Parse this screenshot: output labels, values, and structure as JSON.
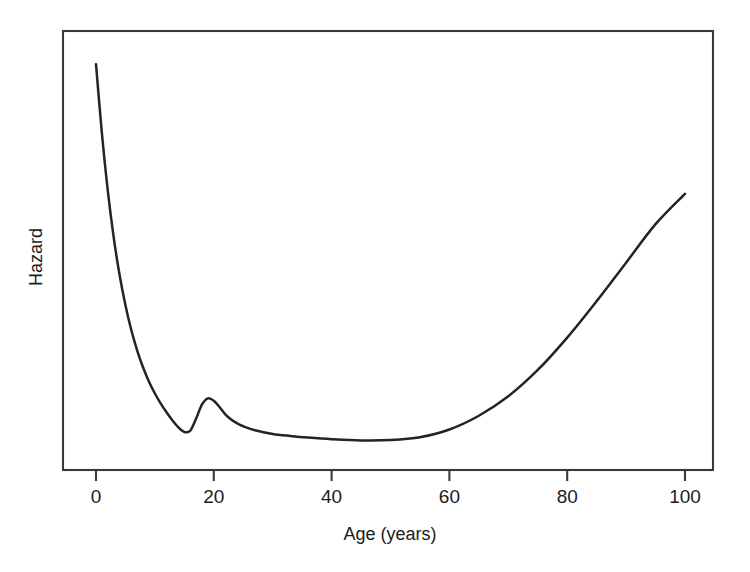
{
  "figure": {
    "name": "hazard-vs-age-bathtub-curve",
    "background_color": "#ffffff",
    "line_color": "#242424",
    "axis_color": "#3a3a3a",
    "text_color": "#1c1c1c"
  },
  "chart_data": {
    "type": "line",
    "title": "",
    "subtitle": "",
    "xlabel": "Age (years)",
    "ylabel": "Hazard",
    "xlim": [
      -5,
      105
    ],
    "ylim": [
      0,
      1
    ],
    "xticks": [
      0,
      20,
      40,
      60,
      80,
      100
    ],
    "xtick_labels": [
      "0",
      "20",
      "40",
      "60",
      "80",
      "100"
    ],
    "yticks": [],
    "ytick_labels": [],
    "grid": false,
    "legend": null,
    "annotations": [],
    "axis_frame": "box",
    "series": [
      {
        "name": "Hazard",
        "x": [
          0,
          1,
          2,
          3,
          4,
          5,
          6,
          7,
          8,
          9,
          10,
          11,
          12,
          13,
          14,
          15,
          16,
          17,
          18,
          19,
          20,
          21,
          22,
          23,
          24,
          25,
          27,
          30,
          33,
          36,
          40,
          45,
          50,
          55,
          60,
          65,
          70,
          75,
          80,
          85,
          90,
          95,
          100
        ],
        "y": [
          0.96,
          0.79,
          0.648,
          0.533,
          0.44,
          0.365,
          0.303,
          0.253,
          0.211,
          0.176,
          0.147,
          0.122,
          0.1,
          0.08,
          0.063,
          0.052,
          0.055,
          0.085,
          0.12,
          0.135,
          0.129,
          0.113,
          0.095,
          0.082,
          0.073,
          0.066,
          0.056,
          0.047,
          0.042,
          0.038,
          0.034,
          0.031,
          0.032,
          0.039,
          0.058,
          0.092,
          0.14,
          0.205,
          0.285,
          0.375,
          0.47,
          0.565,
          0.64
        ],
        "description": "Bathtub-shaped hazard: high infant mortality, young-adult accident hump near age 20, low plateau through middle age, and accelerating rise after age 60."
      }
    ]
  },
  "axis_titles": {
    "x": "Age (years)",
    "y": "Hazard"
  }
}
